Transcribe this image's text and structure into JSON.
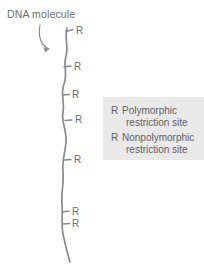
{
  "figure": {
    "width": 204,
    "height": 275,
    "background": "#ffffff"
  },
  "callout": {
    "label": "DNA molecule",
    "arrow_icon": "curved-arrow-icon",
    "color": "#6e6e72"
  },
  "dna": {
    "name": "dna-molecule-strand",
    "color": "#8a8a8e",
    "stroke_width": 1.6,
    "top_y": 28,
    "bottom_y": 262
  },
  "restriction_sites": [
    {
      "label": "R",
      "y": 32,
      "tick_x": 66,
      "label_x": 76,
      "type": "polymorphic"
    },
    {
      "label": "R",
      "y": 67,
      "tick_x": 63,
      "label_x": 74,
      "type": "polymorphic"
    },
    {
      "label": "R",
      "y": 95,
      "tick_x": 62,
      "label_x": 72,
      "type": "polymorphic"
    },
    {
      "label": "R",
      "y": 120,
      "tick_x": 65,
      "label_x": 75,
      "type": "polymorphic"
    },
    {
      "label": "R",
      "y": 160,
      "tick_x": 64,
      "label_x": 74,
      "type": "polymorphic"
    },
    {
      "label": "R",
      "y": 212,
      "tick_x": 62,
      "label_x": 72,
      "type": "polymorphic"
    },
    {
      "label": "R",
      "y": 224,
      "tick_x": 62,
      "label_x": 72,
      "type": "polymorphic"
    }
  ],
  "legend": {
    "background": "#e9e9e9",
    "text_color": "#5f5f63",
    "entries": [
      {
        "key": "R",
        "line1": "Polymorphic",
        "line2": "restriction site"
      },
      {
        "key": "R",
        "line1": "Nonpolymorphic",
        "line2": "restriction site"
      }
    ]
  }
}
